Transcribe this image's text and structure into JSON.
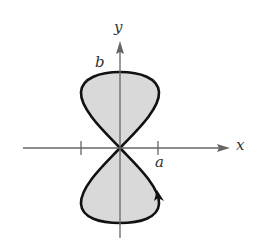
{
  "figure": {
    "type": "polar-curve-figure-eight",
    "axes": {
      "x_label": "x",
      "y_label": "y"
    },
    "annotations": {
      "top_intercept": "b",
      "x_tick": "a"
    },
    "colors": {
      "fill": "#d9d9d9",
      "curve": "#111111",
      "axis": "#666666"
    }
  }
}
